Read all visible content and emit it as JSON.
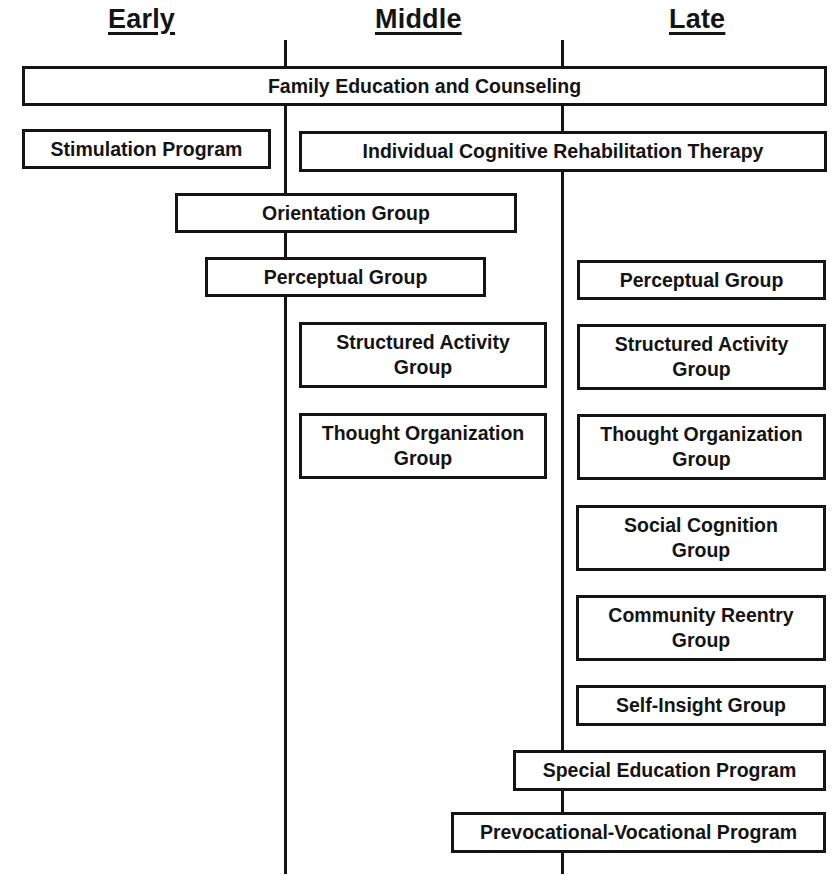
{
  "diagram": {
    "phases": [
      {
        "id": "early",
        "label": "Early"
      },
      {
        "id": "middle",
        "label": "Middle"
      },
      {
        "id": "late",
        "label": "Late"
      }
    ],
    "programs": [
      {
        "id": "family-education",
        "label": "Family Education and Counseling",
        "phases": [
          "early",
          "middle",
          "late"
        ]
      },
      {
        "id": "stimulation",
        "label": "Stimulation Program",
        "phases": [
          "early"
        ]
      },
      {
        "id": "individual-crt",
        "label": "Individual Cognitive Rehabilitation Therapy",
        "phases": [
          "middle",
          "late"
        ]
      },
      {
        "id": "orientation",
        "label": "Orientation Group",
        "phases": [
          "early",
          "middle"
        ]
      },
      {
        "id": "perceptual-early",
        "label": "Perceptual Group",
        "phases": [
          "early",
          "middle"
        ]
      },
      {
        "id": "perceptual-late",
        "label": "Perceptual Group",
        "phases": [
          "late"
        ]
      },
      {
        "id": "structured-middle",
        "label_line1": "Structured Activity",
        "label_line2": "Group",
        "phases": [
          "middle"
        ]
      },
      {
        "id": "structured-late",
        "label_line1": "Structured Activity",
        "label_line2": "Group",
        "phases": [
          "late"
        ]
      },
      {
        "id": "thought-middle",
        "label_line1": "Thought Organization",
        "label_line2": "Group",
        "phases": [
          "middle"
        ]
      },
      {
        "id": "thought-late",
        "label_line1": "Thought Organization",
        "label_line2": "Group",
        "phases": [
          "late"
        ]
      },
      {
        "id": "social-cognition",
        "label_line1": "Social Cognition",
        "label_line2": "Group",
        "phases": [
          "late"
        ]
      },
      {
        "id": "community-reentry",
        "label_line1": "Community Reentry",
        "label_line2": "Group",
        "phases": [
          "late"
        ]
      },
      {
        "id": "self-insight",
        "label": "Self-Insight Group",
        "phases": [
          "late"
        ]
      },
      {
        "id": "special-education",
        "label": "Special Education Program",
        "phases": [
          "middle",
          "late"
        ]
      },
      {
        "id": "prevocational",
        "label": "Prevocational-Vocational Program",
        "phases": [
          "middle",
          "late"
        ]
      }
    ]
  }
}
